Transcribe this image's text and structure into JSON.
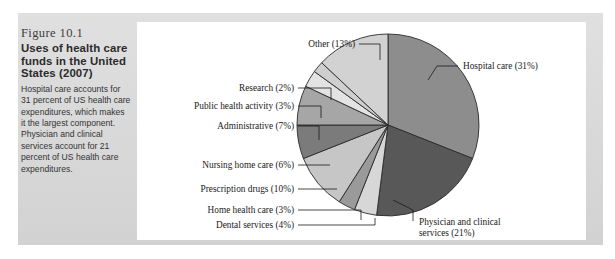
{
  "figure": {
    "number": "Figure 10.1",
    "title": "Uses of health care funds in the United States (2007)",
    "description": "Hospital care accounts for 31 percent of US health care expenditures, which makes it the largest component. Physician and clinical services account for 21 percent of US health care expenditures."
  },
  "chart_data": {
    "type": "pie",
    "title": "Uses of health care funds in the United States (2007)",
    "xlabel": "",
    "ylabel": "",
    "unit": "percent",
    "legend_position": "callout-labels",
    "grid": false,
    "start_angle_deg": -90,
    "direction": "clockwise",
    "categories": [
      "Hospital care",
      "Physician and clinical services",
      "Dental services",
      "Home health care",
      "Prescription drugs",
      "Nursing home care",
      "Administrative",
      "Public health activity",
      "Research",
      "Other"
    ],
    "values": [
      31,
      21,
      4,
      3,
      10,
      6,
      7,
      3,
      2,
      13
    ],
    "labels": [
      "Hospital care (31%)",
      "Physician and clinical services (21%)",
      "Dental services (4%)",
      "Home health care (3%)",
      "Prescription drugs (10%)",
      "Nursing home care (6%)",
      "Administrative (7%)",
      "Public health activity (3%)",
      "Research (2%)",
      "Other (13%)"
    ],
    "colors": [
      "#8d8d8d",
      "#585858",
      "#d7d7d7",
      "#9a9a9a",
      "#c6c6c6",
      "#7b7b7b",
      "#a6a6a6",
      "#e3e3e3",
      "#cfcfcf",
      "#d2d2d2"
    ],
    "total": 100
  },
  "callouts": {
    "hospital_care": "Hospital care (31%)",
    "physician_line1": "Physician and clinical",
    "physician_line2": "services (21%)",
    "other": "Other (13%)",
    "research": "Research (2%)",
    "public_health": "Public health activity (3%)",
    "administrative": "Administrative (7%)",
    "nursing_home": "Nursing home care (6%)",
    "prescription_drugs": "Prescription drugs (10%)",
    "home_health": "Home health care (3%)",
    "dental": "Dental services (4%)"
  }
}
